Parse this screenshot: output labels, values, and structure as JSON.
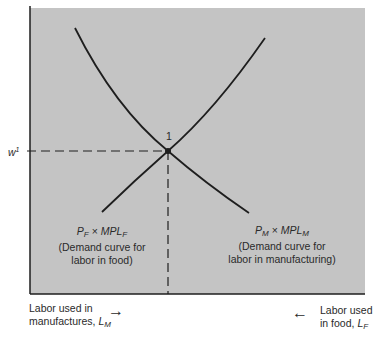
{
  "diagram": {
    "background_color": "#c4c4c4",
    "line_color": "#1e1e1e",
    "equilibrium": {
      "point_label": "1",
      "wage_label": "w",
      "wage_superscript": "1"
    },
    "curves": [
      {
        "name": "food-demand-curve",
        "formula_left": "P",
        "formula_left_sub": "F",
        "formula_op": " × ",
        "formula_right": "MPL",
        "formula_right_sub": "F",
        "desc_line1": "(Demand curve for",
        "desc_line2": "labor in food)"
      },
      {
        "name": "manufacturing-demand-curve",
        "formula_left": "P",
        "formula_left_sub": "M",
        "formula_op": " × ",
        "formula_right": "MPL",
        "formula_right_sub": "M",
        "desc_line1": "(Demand curve for",
        "desc_line2": "labor in manufacturing)"
      }
    ],
    "axis_left": {
      "line1": "Labor used in",
      "line2": "manufactures, ",
      "var": "L",
      "var_sub": "M",
      "arrow": "→"
    },
    "axis_right": {
      "line1": "Labor used",
      "line2": "in food, ",
      "var": "L",
      "var_sub": "F",
      "arrow": "←"
    }
  }
}
